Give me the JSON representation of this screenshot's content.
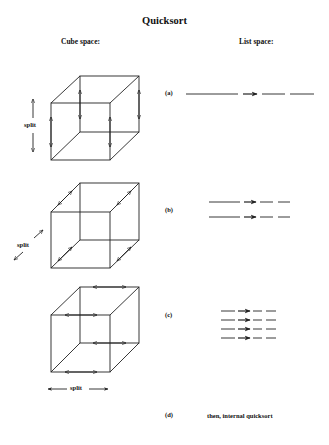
{
  "title": "Quicksort",
  "columns": {
    "cube": "Cube space:",
    "list": "List space:"
  },
  "steps": [
    {
      "label": "(a)",
      "split_label": "split",
      "split_direction": "vertical",
      "list_rows": 1,
      "description": ""
    },
    {
      "label": "(b)",
      "split_label": "split",
      "split_direction": "depth",
      "list_rows": 2,
      "description": ""
    },
    {
      "label": "(c)",
      "split_label": "split",
      "split_direction": "horizontal",
      "list_rows": 4,
      "description": ""
    },
    {
      "label": "(d)",
      "description": "then, internal quicksort"
    }
  ],
  "colors": {
    "stroke": "#222222",
    "background": "#ffffff"
  }
}
